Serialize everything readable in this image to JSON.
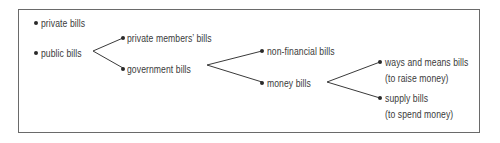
{
  "diagram": {
    "type": "tree",
    "nodes": {
      "private_bills": {
        "label": "private bills"
      },
      "public_bills": {
        "label": "public bills"
      },
      "private_members_bills": {
        "label": "private members’ bills"
      },
      "government_bills": {
        "label": "government bills"
      },
      "non_financial_bills": {
        "label": "non-financial bills"
      },
      "money_bills": {
        "label": "money bills"
      },
      "ways_and_means_bills": {
        "label": "ways and means bills",
        "note": "(to raise money)"
      },
      "supply_bills": {
        "label": "supply bills",
        "note": "(to spend money)"
      }
    },
    "edges": [
      [
        "public_bills",
        "private_members_bills"
      ],
      [
        "public_bills",
        "government_bills"
      ],
      [
        "government_bills",
        "non_financial_bills"
      ],
      [
        "government_bills",
        "money_bills"
      ],
      [
        "money_bills",
        "ways_and_means_bills"
      ],
      [
        "money_bills",
        "supply_bills"
      ]
    ],
    "colors": {
      "line": "#3a3a3a",
      "text": "#3a3a3a",
      "border": "#6a6a6a"
    }
  }
}
